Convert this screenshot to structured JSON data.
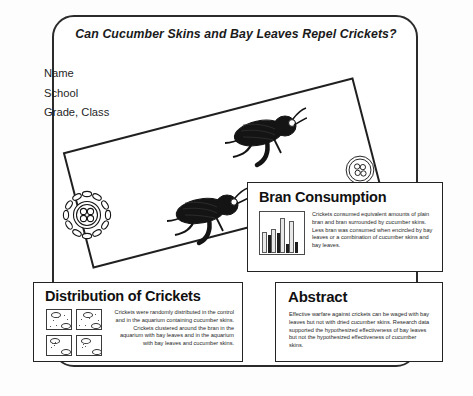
{
  "poster": {
    "title": "Can Cucumber Skins and Bay Leaves Repel Crickets?",
    "identification": {
      "name": "Name",
      "school": "School",
      "grade_class": "Grade, Class"
    }
  },
  "panels": {
    "bran": {
      "title": "Bran Consumption",
      "body": "Crickets consumed equivalent amounts of plain bran and bran surrounded by cucumber skins. Less bran was consumed when encircled by bay leaves or a combination of cucumber skins and bay leaves."
    },
    "distribution": {
      "title": "Distribution of Crickets",
      "body": "Crickets were randomly distributed in the control and in the aquarium containing cucumber skins. Crickets clustered around the bran in the aquarium with bay leaves and in the aquarium with bay leaves and cucumber skins."
    },
    "abstract": {
      "title": "Abstract",
      "body": "Effective warfare against crickets can be waged with bay leaves but not with dried cucumber skins. Research data supported the hypothesized effectiveness of bay leaves but not the hypothesized effectiveness of cucumber skins."
    }
  },
  "chart_data": {
    "type": "bar",
    "title": "Bran Consumption",
    "xlabel": "",
    "ylabel": "",
    "grid": false,
    "legend": "none",
    "ylim": [
      0,
      100
    ],
    "categories": [
      "Plain bran",
      "Cucumber skins",
      "Bay leaves",
      "Bay leaves + cucumber skins"
    ],
    "series": [
      {
        "name": "Bran remaining (light)",
        "values": [
          50,
          57,
          86,
          80
        ]
      },
      {
        "name": "Bran consumed (dark)",
        "values": [
          47,
          52,
          24,
          30
        ]
      }
    ]
  },
  "colors": {
    "frame": "#2b2b2b",
    "panel_border": "#232323",
    "ink": "#1b1b1b",
    "bar_dark": "#1d1d1d",
    "bar_light": "#e8e8e8",
    "page": "#f2f2f2"
  },
  "icons": {
    "cricket": "cricket-icon",
    "bran_ring": "bran-encircled-by-bay-leaves-icon",
    "aquarium": "aquarium-icon"
  }
}
